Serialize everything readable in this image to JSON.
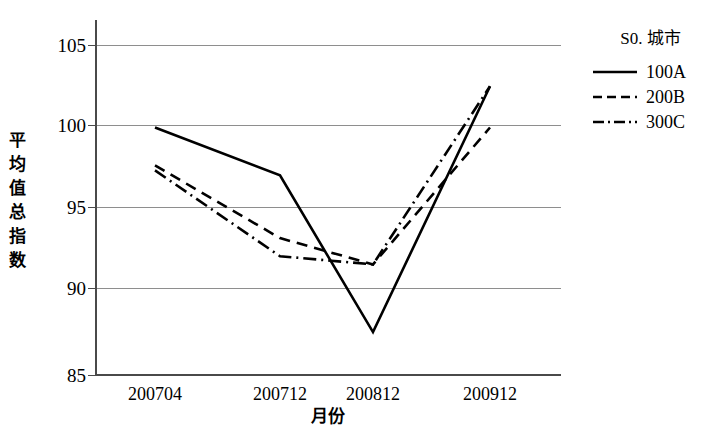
{
  "chart_data": {
    "type": "line",
    "title": "",
    "xlabel": "月份",
    "ylabel": "平均值总指数",
    "categories": [
      "200704",
      "200712",
      "200812",
      "200912"
    ],
    "ylim": [
      85,
      105
    ],
    "yticks": [
      85,
      90,
      95,
      100,
      105
    ],
    "grid": true,
    "legend_position": "right",
    "legend_title": "S0. 城市",
    "series": [
      {
        "name": "100A",
        "style": "solid",
        "values": [
          100.0,
          97.1,
          87.6,
          102.5
        ]
      },
      {
        "name": "200B",
        "style": "dashed",
        "values": [
          97.7,
          93.3,
          91.7,
          100.0
        ]
      },
      {
        "name": "300C",
        "style": "dashdot",
        "values": [
          97.4,
          92.2,
          91.7,
          102.5
        ]
      }
    ]
  },
  "axes": {
    "y_title_chars": [
      "平",
      "均",
      "值",
      "总",
      "指",
      "数"
    ],
    "y_tick_labels": [
      "105",
      "100",
      "95",
      "90",
      "85"
    ],
    "x_tick_labels": [
      "200704",
      "200712",
      "200812",
      "200912"
    ],
    "x_title": "月份"
  },
  "legend": {
    "title": "S0. 城市",
    "entries": [
      {
        "label": "100A",
        "style": "solid"
      },
      {
        "label": "200B",
        "style": "dashed"
      },
      {
        "label": "300C",
        "style": "dashdot"
      }
    ]
  },
  "colors": {
    "line": "#000000",
    "grid": "#8e8e8e",
    "axis": "#4a4a4a",
    "background": "#ffffff"
  }
}
